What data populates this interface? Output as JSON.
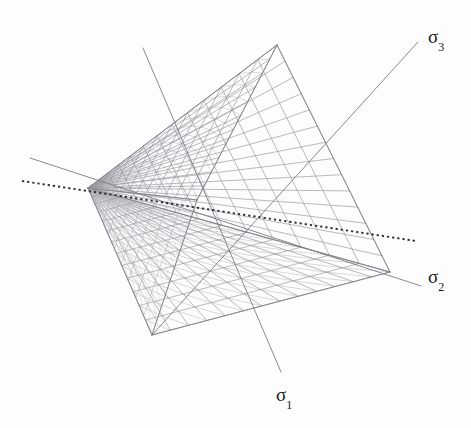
{
  "figure": {
    "name": "mohr-coulomb-yield-surface",
    "background_color": "#fdfdfd",
    "mesh_color": "#8e8e96",
    "axis_line_color": "#7b7b84",
    "hydrostatic_axis_color": "#2b2b30",
    "label_color": "#1a1a1a"
  },
  "axes": [
    {
      "id": "sigma1",
      "symbol": "σ",
      "subscript": "1",
      "label": "σ₁",
      "style": "solid",
      "start": [
        143,
        48
      ],
      "end": [
        281,
        372
      ]
    },
    {
      "id": "sigma2",
      "symbol": "σ",
      "subscript": "2",
      "label": "σ₂",
      "style": "solid",
      "start": [
        30,
        158
      ],
      "end": [
        421,
        286
      ]
    },
    {
      "id": "sigma3",
      "symbol": "σ",
      "subscript": "3",
      "label": "σ₃",
      "style": "solid",
      "start": [
        418,
        42
      ],
      "end": [
        152,
        335
      ]
    }
  ],
  "hydrostatic_axis": {
    "id": "hydrostatic-axis",
    "label": "",
    "style": "dotted",
    "start": [
      22,
      181
    ],
    "end": [
      416,
      241
    ]
  },
  "surface": {
    "apex": [
      88,
      188
    ],
    "open_end_vertices": {
      "top": [
        277,
        45
      ],
      "right": [
        390,
        272
      ],
      "bottom": [
        152,
        335
      ]
    },
    "interior_vertex": [
      197,
      200
    ],
    "radial_divisions": 14,
    "transverse_divisions": 13
  },
  "chart_data": {
    "type": "diagram",
    "title": "",
    "subtitle": "",
    "xlabel": "",
    "ylabel": "",
    "annotations": [
      "σ₁",
      "σ₂",
      "σ₃"
    ],
    "legend": []
  },
  "ghost_lines": [
    {
      "text": "",
      "left": 60,
      "top": 30
    },
    {
      "text": "",
      "left": 95,
      "top": 52
    }
  ]
}
